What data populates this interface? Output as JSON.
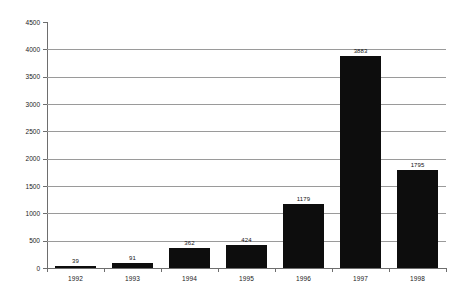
{
  "chart_data": {
    "type": "bar",
    "title": "",
    "xlabel": "",
    "ylabel": "",
    "categories": [
      "1992",
      "1993",
      "1994",
      "1995",
      "1996",
      "1997",
      "1998"
    ],
    "values": [
      39,
      91,
      362,
      424,
      1179,
      3883,
      1795
    ],
    "value_labels": [
      "39",
      "91",
      "362",
      "424",
      "1179",
      "3883",
      "1795"
    ],
    "ylim": [
      0,
      4500
    ],
    "ytick_values": [
      0,
      500,
      1000,
      1500,
      2000,
      2500,
      3000,
      3500,
      4000,
      4500
    ],
    "ytick_labels": [
      "0",
      "500",
      "1000",
      "1500",
      "2000",
      "2500",
      "3000",
      "3500",
      "4000",
      "4500"
    ],
    "grid": true,
    "grid_axis": "y",
    "legend": false,
    "legend_position": "none",
    "series": [
      {
        "name": "",
        "values": [
          39,
          91,
          362,
          424,
          1179,
          3883,
          1795
        ]
      }
    ],
    "colors": {
      "bar": "#0d0d0d",
      "grid": "#9a9a9a",
      "axis": "#6e6e6e",
      "background": "#ffffff",
      "text": "#1a1a1a"
    }
  }
}
